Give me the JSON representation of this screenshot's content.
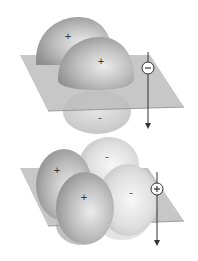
{
  "diagram": {
    "top": {
      "description": "Two in-phase p-orbital lobes above a nodal plane (bonding)",
      "lobes": [
        {
          "position": "back-upper",
          "sign": "+"
        },
        {
          "position": "front-upper",
          "sign": "+"
        },
        {
          "position": "below-plane",
          "sign": "–"
        }
      ],
      "phase_indicator": {
        "sign": "–",
        "direction": "down-arrow"
      }
    },
    "bottom": {
      "description": "Four lobes, two positive and two negative, split by plane (antibonding)",
      "lobes": [
        {
          "position": "back-left",
          "sign": "+"
        },
        {
          "position": "back-right",
          "sign": "–"
        },
        {
          "position": "front-left",
          "sign": "+"
        },
        {
          "position": "front-right",
          "sign": "–"
        }
      ],
      "phase_indicator": {
        "sign": "+",
        "direction": "down-arrow"
      }
    }
  },
  "colors": {
    "plane": "#b8b8b8",
    "lobe_dark": "#9a9a9a",
    "lobe_light": "#d9d9d9",
    "line": "#333333"
  }
}
